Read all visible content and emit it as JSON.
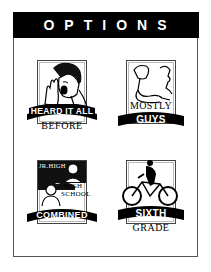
{
  "header": {
    "title": "OPTIONS",
    "background": "#000000",
    "color": "#ffffff"
  },
  "options": [
    {
      "id": "heard-it-all-before",
      "ribbon": "HEARD IT ALL",
      "sub": "BEFORE",
      "icon": "yawning-man-icon"
    },
    {
      "id": "mostly-guys",
      "upper": "MOSTLY",
      "ribbon": "GUYS",
      "icon": "flexing-arm-icon"
    },
    {
      "id": "combined",
      "top_small": "JR.HIGH",
      "mid": "HIGH SCHOOL",
      "ribbon": "COMBINED",
      "icon": "two-students-icon"
    },
    {
      "id": "sixth-grade",
      "ribbon": "SIXTH",
      "sub": "GRADE",
      "icon": "bicycle-rider-icon"
    }
  ]
}
